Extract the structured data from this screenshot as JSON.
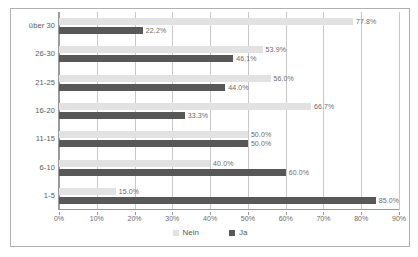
{
  "chart_data": {
    "type": "bar",
    "orientation": "horizontal",
    "title": "",
    "xlabel": "",
    "ylabel": "",
    "xlim": [
      0,
      90
    ],
    "grid": true,
    "legend_position": "bottom",
    "categories": [
      "über 30",
      "26-30",
      "21-25",
      "16-20",
      "11-15",
      "6-10",
      "1-5"
    ],
    "xticks": [
      0,
      10,
      20,
      30,
      40,
      50,
      60,
      70,
      80,
      90
    ],
    "xticklabels": [
      "0%",
      "10%",
      "20%",
      "30%",
      "40%",
      "50%",
      "60%",
      "70%",
      "80%",
      "90%"
    ],
    "series": [
      {
        "name": "Nein",
        "color": "#e2e2e2",
        "values": [
          77.8,
          53.9,
          56.0,
          66.7,
          50.0,
          40.0,
          15.0
        ],
        "labels": [
          "77.8%",
          "53.9%",
          "56.0%",
          "66.7%",
          "50.0%",
          "40.0%",
          "15.0%"
        ]
      },
      {
        "name": "Ja",
        "color": "#585858",
        "values": [
          22.2,
          46.1,
          44.0,
          33.3,
          50.0,
          60.0,
          85.0
        ],
        "labels": [
          "22.2%",
          "46.1%",
          "44.0%",
          "33.3%",
          "50.0%",
          "60.0%",
          "85.0%"
        ]
      }
    ]
  },
  "legend": {
    "items": [
      {
        "label": "Nein",
        "color": "#e2e2e2"
      },
      {
        "label": "Ja",
        "color": "#585858"
      }
    ]
  }
}
